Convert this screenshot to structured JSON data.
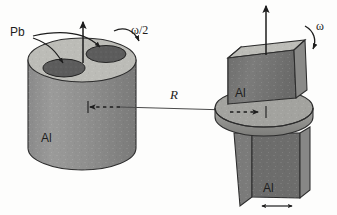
{
  "figure": {
    "caption_present": false,
    "background_color": "#fdfdfc",
    "line_color": "#1d1d1d"
  },
  "palette": {
    "body_fill": "#8d8d8d",
    "body_fill_dark": "#6f6f6f",
    "top_fill": "#b9b9b5",
    "top_fill_light": "#c3c3bf",
    "inclusion_fill": "#5a5a5a",
    "outline": "#2a2a2a",
    "label_text": "#1d1d1d"
  },
  "left_object": {
    "name": "rotating-cylinder",
    "body_label": "Al",
    "inclusion_label": "Pb",
    "inclusion_count": 2,
    "spin_label": "ω/2",
    "axis_arrow": "up",
    "radius_arrow": "left"
  },
  "right_object": {
    "name": "rotating-block-assembly",
    "upper_block_label": "Al",
    "lower_block_label": "Al",
    "spin_label": "ω",
    "axis_arrow": "up",
    "radius_arrow": "right"
  },
  "connector": {
    "name": "radius-connector",
    "label": "R",
    "description": "horizontal line linking the two rotation axes"
  },
  "icons": {
    "up_arrow": "arrow-up-icon",
    "curved_arrow": "rotation-arrow-icon",
    "dashed_arrow": "dashed-arrow-icon",
    "double_arrow": "double-headed-arrow-icon",
    "leader_line": "leader-line-icon"
  }
}
